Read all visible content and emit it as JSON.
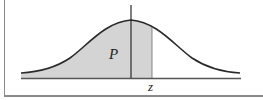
{
  "diagram": {
    "type": "normal-distribution-cumulative-area",
    "labels": {
      "area": "P",
      "x_marker": "z"
    },
    "colors": {
      "curve": "#2a2a2a",
      "shade": "#d4d4d4",
      "axis": "#555555",
      "frame": "#8a8a8a"
    }
  }
}
